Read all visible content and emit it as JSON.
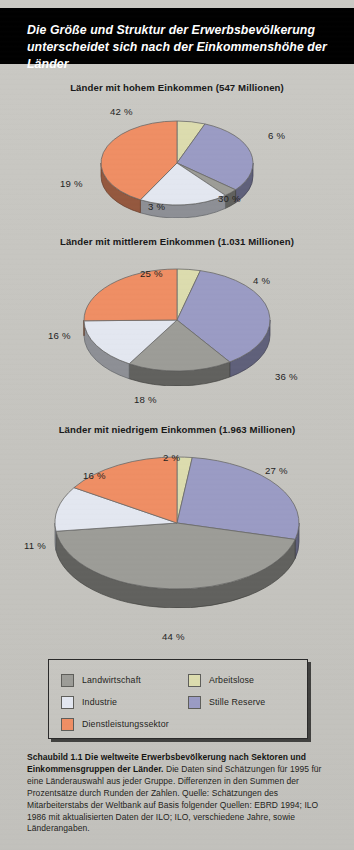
{
  "header": {
    "title": "Die Größe und Struktur der Erwerbsbevölkerung unterscheidet sich nach der Einkommenshöhe der Länder"
  },
  "legend": {
    "items": [
      {
        "label": "Landwirtschaft",
        "color": "#9c9c97"
      },
      {
        "label": "Arbeitslose",
        "color": "#dcdcae"
      },
      {
        "label": "Industrie",
        "color": "#e3e7f0"
      },
      {
        "label": "Stille Reserve",
        "color": "#9a9bc4"
      },
      {
        "label": "Dienstleistungssektor",
        "color": "#ef8e64"
      }
    ]
  },
  "caption": {
    "bold": "Schaubild 1.1   Die weltweite Erwerbsbevölkerung nach Sektoren und Einkommensgruppen der Länder.",
    "body": " Die Daten sind Schätzungen für 1995 für eine Länderauswahl aus jeder Gruppe. Differenzen in den Summen der Prozentsätze durch Runden der Zahlen. Quelle: Schätzungen des Mitarbeiterstabs der Weltbank auf Basis folgender Quellen: EBRD 1994; ILO 1986 mit aktualisierten Daten der ILO; ILO, verschiedene Jahre, sowie Länderangaben."
  },
  "chart_data": [
    {
      "type": "pie",
      "title": "Länder mit hohem Einkommen (547 Millionen)",
      "group": "Hohes Einkommen",
      "total_millions": 547,
      "categories": [
        "Arbeitslose",
        "Stille Reserve",
        "Landwirtschaft",
        "Industrie",
        "Dienstleistungssektor"
      ],
      "values": [
        6,
        30,
        3,
        19,
        42
      ],
      "labels": [
        "6 %",
        "30 %",
        "3 %",
        "19 %",
        "42 %"
      ],
      "colors": [
        "#dcdcae",
        "#9a9bc4",
        "#9c9c97",
        "#e3e7f0",
        "#ef8e64"
      ],
      "unit": "%",
      "start_angle_deg": 0,
      "direction": "clockwise"
    },
    {
      "type": "pie",
      "title": "Länder mit mittlerem Einkommen (1.031 Millionen)",
      "group": "Mittleres Einkommen",
      "total_millions": 1031,
      "categories": [
        "Arbeitslose",
        "Stille Reserve",
        "Landwirtschaft",
        "Industrie",
        "Dienstleistungssektor"
      ],
      "values": [
        4,
        36,
        18,
        16,
        25
      ],
      "labels": [
        "4 %",
        "36 %",
        "18 %",
        "16 %",
        "25 %"
      ],
      "colors": [
        "#dcdcae",
        "#9a9bc4",
        "#9c9c97",
        "#e3e7f0",
        "#ef8e64"
      ],
      "unit": "%",
      "start_angle_deg": 0,
      "direction": "clockwise"
    },
    {
      "type": "pie",
      "title": "Länder mit niedrigem Einkommen (1.963 Millionen)",
      "group": "Niedriges Einkommen",
      "total_millions": 1963,
      "categories": [
        "Arbeitslose",
        "Stille Reserve",
        "Landwirtschaft",
        "Industrie",
        "Dienstleistungssektor"
      ],
      "values": [
        2,
        27,
        44,
        11,
        16
      ],
      "labels": [
        "2 %",
        "27 %",
        "44 %",
        "11 %",
        "16 %"
      ],
      "colors": [
        "#dcdcae",
        "#9a9bc4",
        "#9c9c97",
        "#e3e7f0",
        "#ef8e64"
      ],
      "unit": "%",
      "start_angle_deg": 0,
      "direction": "clockwise"
    }
  ],
  "charts_layout": [
    {
      "top": 82,
      "pie_cx": 177,
      "pie_cy": 60,
      "rx": 76,
      "ry": 42,
      "depth": 13,
      "pct_positions": [
        {
          "i": 0,
          "x": 268,
          "y": 130
        },
        {
          "i": 1,
          "x": 218,
          "y": 193
        },
        {
          "i": 2,
          "x": 148,
          "y": 201
        },
        {
          "i": 3,
          "x": 60,
          "y": 178
        },
        {
          "i": 4,
          "x": 110,
          "y": 106
        }
      ]
    },
    {
      "top": 236,
      "pie_cx": 177,
      "pie_cy": 63,
      "rx": 93,
      "ry": 51,
      "depth": 15,
      "pct_positions": [
        {
          "i": 0,
          "x": 253,
          "y": 275
        },
        {
          "i": 1,
          "x": 275,
          "y": 371
        },
        {
          "i": 2,
          "x": 134,
          "y": 394
        },
        {
          "i": 3,
          "x": 48,
          "y": 330
        },
        {
          "i": 4,
          "x": 140,
          "y": 268
        }
      ]
    },
    {
      "top": 424,
      "pie_cx": 177,
      "pie_cy": 78,
      "rx": 122,
      "ry": 66,
      "depth": 19,
      "pct_positions": [
        {
          "i": 0,
          "x": 163,
          "y": 452
        },
        {
          "i": 1,
          "x": 265,
          "y": 465
        },
        {
          "i": 2,
          "x": 162,
          "y": 631
        },
        {
          "i": 3,
          "x": 24,
          "y": 540
        },
        {
          "i": 4,
          "x": 83,
          "y": 470
        }
      ]
    }
  ]
}
